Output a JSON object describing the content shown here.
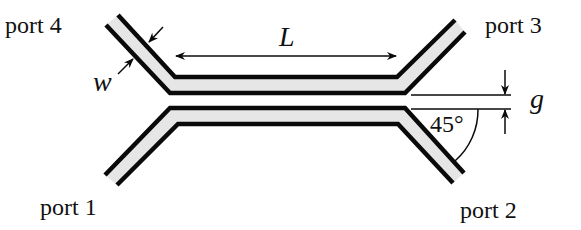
{
  "diagram": {
    "ports": {
      "port1": "port 1",
      "port2": "port 2",
      "port3": "port 3",
      "port4": "port 4"
    },
    "dimensions": {
      "length_label": "L",
      "width_label": "w",
      "gap_label": "g",
      "angle_label": "45°"
    },
    "colors": {
      "line": "#0a0a0a",
      "strip_fill": "#e6e6e6",
      "background": "#ffffff"
    }
  }
}
